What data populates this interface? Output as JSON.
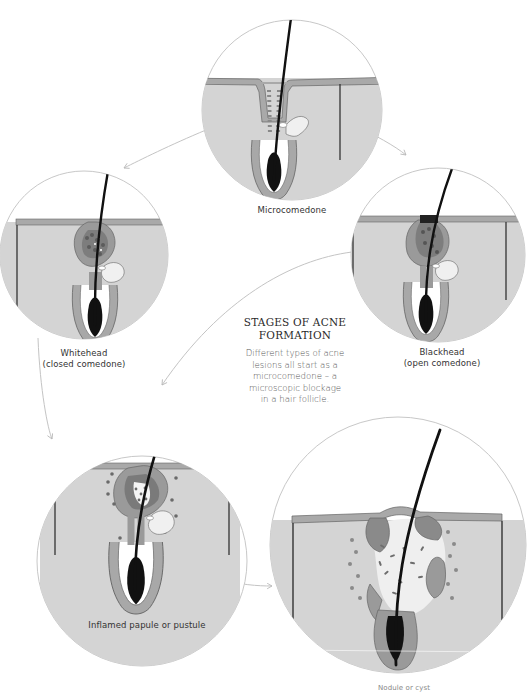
{
  "infographic": {
    "title_lines": [
      "STAGES OF ACNE",
      "FORMATION"
    ],
    "description_lines": [
      "Different types of acne",
      "lesions all start as a",
      "microcomedone – a",
      "microscopic blockage",
      "in a hair follicle."
    ]
  },
  "stages": [
    {
      "id": "microcomedone",
      "label_lines": [
        "Microcomedone"
      ]
    },
    {
      "id": "whitehead",
      "label_lines": [
        "Whitehead",
        "(closed comedone)"
      ]
    },
    {
      "id": "blackhead",
      "label_lines": [
        "Blackhead",
        "(open comedone)"
      ]
    },
    {
      "id": "inflamed",
      "label_lines": [
        "Inflamed papule or pustule"
      ]
    },
    {
      "id": "nodule",
      "label_lines": [
        "Nodule or cyst"
      ]
    }
  ],
  "colors": {
    "skin_fill": "#d4d4d4",
    "skin_surface": "#a9a9a9",
    "follicle_wall": "#9a9a9a",
    "plug": "#7a7a7a",
    "hair": "#111111",
    "circle_stroke": "#bdbdbd",
    "arrow_stroke": "#c4c4c4"
  }
}
